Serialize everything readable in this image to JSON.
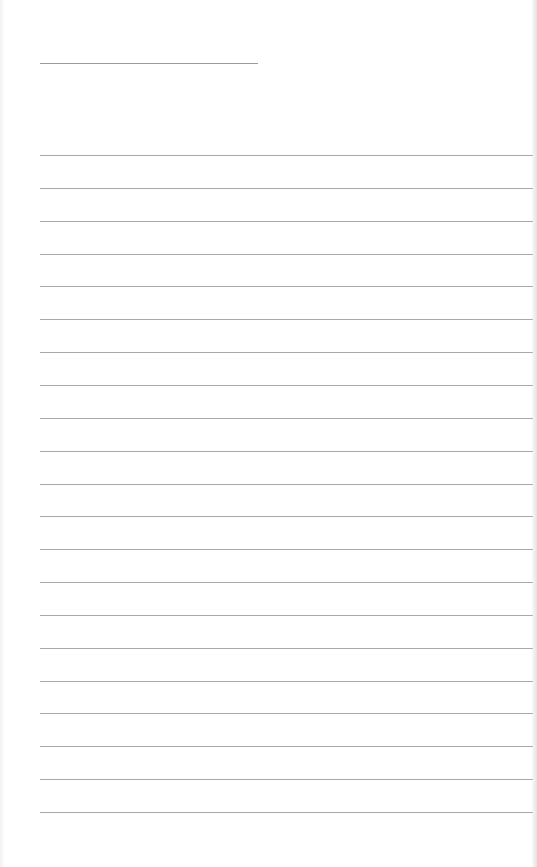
{
  "page": {
    "type": "lined-paper",
    "background_color": "#ffffff",
    "line_color": "#a8a8a8",
    "title_line": {
      "x": 40,
      "y": 63,
      "width": 218,
      "color": "#9a9a9a"
    },
    "rules": {
      "count": 21,
      "x": 40,
      "first_y": 155,
      "spacing": 32.85,
      "width": 493
    },
    "text_content": []
  }
}
